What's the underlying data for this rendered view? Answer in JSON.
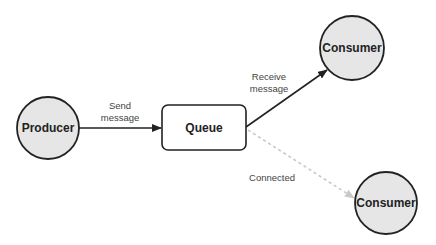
{
  "diagram": {
    "nodes": [
      {
        "id": "producer",
        "label": "Producer",
        "shape": "circle",
        "cx": 48,
        "cy": 128,
        "r": 31,
        "fill": "#e6e6e6"
      },
      {
        "id": "queue",
        "label": "Queue",
        "shape": "rounded-rect",
        "x": 162,
        "y": 105,
        "w": 84,
        "h": 45,
        "fill": "#ffffff"
      },
      {
        "id": "consumer1",
        "label": "Consumer",
        "shape": "circle",
        "cx": 352,
        "cy": 48,
        "r": 32,
        "fill": "#e6e6e6"
      },
      {
        "id": "consumer2",
        "label": "Consumer",
        "shape": "circle",
        "cx": 386,
        "cy": 203,
        "r": 31,
        "fill": "#e6e6e6"
      }
    ],
    "edges": [
      {
        "from": "producer",
        "to": "queue",
        "label_lines": [
          "Send",
          "message"
        ],
        "style": "solid",
        "color": "#222222"
      },
      {
        "from": "queue",
        "to": "consumer1",
        "label_lines": [
          "Receive",
          "message"
        ],
        "style": "solid",
        "color": "#222222"
      },
      {
        "from": "queue",
        "to": "consumer2",
        "label_lines": [
          "Connected"
        ],
        "style": "dashed",
        "color": "#c8c8c8"
      }
    ]
  },
  "labels": {
    "producer": "Producer",
    "queue": "Queue",
    "consumer1": "Consumer",
    "consumer2": "Consumer",
    "send_1": "Send",
    "send_2": "message",
    "receive_1": "Receive",
    "receive_2": "message",
    "connected": "Connected"
  }
}
